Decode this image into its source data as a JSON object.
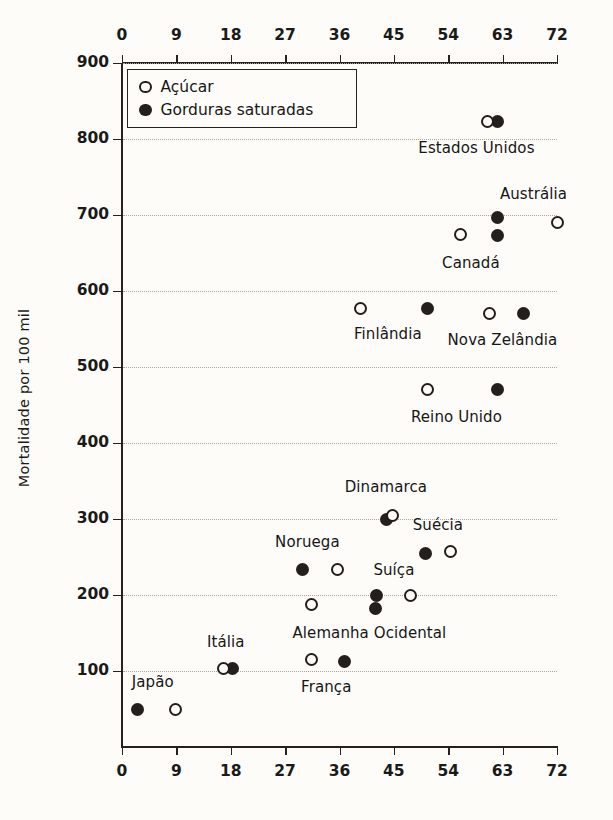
{
  "chart_data": {
    "type": "scatter",
    "title": "",
    "xlabel": "",
    "ylabel": "Mortalidade por 100 mil",
    "xlim": [
      0,
      72
    ],
    "ylim": [
      0,
      900
    ],
    "xticks": [
      0,
      9,
      18,
      27,
      36,
      45,
      54,
      63,
      72
    ],
    "yticks": [
      100,
      200,
      300,
      400,
      500,
      600,
      700,
      800,
      900
    ],
    "grid": true,
    "x_axis_duplicated_top_and_bottom": true,
    "legend": {
      "position": "top-left-inside",
      "entries": [
        {
          "label": "Açúcar",
          "marker": "open-circle"
        },
        {
          "label": "Gorduras saturadas",
          "marker": "filled-circle"
        }
      ]
    },
    "series": [
      {
        "name": "Açúcar",
        "marker": "open-circle"
      },
      {
        "name": "Gorduras saturadas",
        "marker": "filled-circle"
      }
    ],
    "points": [
      {
        "country": "Estados Unidos",
        "sugar_x": 60.5,
        "sugar_y": 823,
        "fat_x": 62.1,
        "fat_y": 823,
        "label_dx": -16,
        "label_dy": 26
      },
      {
        "country": "Austrália",
        "sugar_x": 72.0,
        "sugar_y": 690,
        "fat_x": 62.2,
        "fat_y": 697,
        "label_dx": 6,
        "label_dy": -26
      },
      {
        "country": "Canadá",
        "sugar_x": 56.0,
        "sugar_y": 675,
        "fat_x": 62.2,
        "fat_y": 673,
        "label_dx": -8,
        "label_dy": 28
      },
      {
        "country": "Finlândia",
        "sugar_x": 39.4,
        "sugar_y": 577,
        "fat_x": 50.6,
        "fat_y": 577,
        "label_dx": -6,
        "label_dy": 26
      },
      {
        "country": "Nova Zelândia",
        "sugar_x": 60.9,
        "sugar_y": 570,
        "fat_x": 66.4,
        "fat_y": 570,
        "label_dx": -4,
        "label_dy": 26
      },
      {
        "country": "Reino Unido",
        "sugar_x": 50.6,
        "sugar_y": 470,
        "fat_x": 62.1,
        "fat_y": 470,
        "label_dx": -6,
        "label_dy": 27
      },
      {
        "country": "Dinamarca",
        "sugar_x": 44.8,
        "sugar_y": 305,
        "fat_x": 43.8,
        "fat_y": 300,
        "label_dx": -4,
        "label_dy": -30
      },
      {
        "country": "Suécia",
        "sugar_x": 54.3,
        "sugar_y": 257,
        "fat_x": 50.2,
        "fat_y": 255,
        "label_dx": 0,
        "label_dy": -27
      },
      {
        "country": "Noruega",
        "sugar_x": 35.6,
        "sugar_y": 234,
        "fat_x": 29.8,
        "fat_y": 234,
        "label_dx": -12,
        "label_dy": -27
      },
      {
        "country": "Suíça",
        "sugar_x": 47.8,
        "sugar_y": 200,
        "fat_x": 42.2,
        "fat_y": 200,
        "label_dx": 0,
        "label_dy": -25
      },
      {
        "country": "Alemanha Ocidental",
        "sugar_x": 31.3,
        "sugar_y": 187,
        "fat_x": 42.0,
        "fat_y": 182,
        "label_dx": 26,
        "label_dy": 26
      },
      {
        "country": "França",
        "sugar_x": 31.4,
        "sugar_y": 115,
        "fat_x": 36.8,
        "fat_y": 113,
        "label_dx": -2,
        "label_dy": 27
      },
      {
        "country": "Itália",
        "sugar_x": 16.8,
        "sugar_y": 103,
        "fat_x": 18.3,
        "fat_y": 103,
        "label_dx": -2,
        "label_dy": -27
      },
      {
        "country": "Japão",
        "sugar_x": 8.9,
        "sugar_y": 50,
        "fat_x": 2.6,
        "fat_y": 50,
        "label_dx": -4,
        "label_dy": -27
      }
    ]
  }
}
